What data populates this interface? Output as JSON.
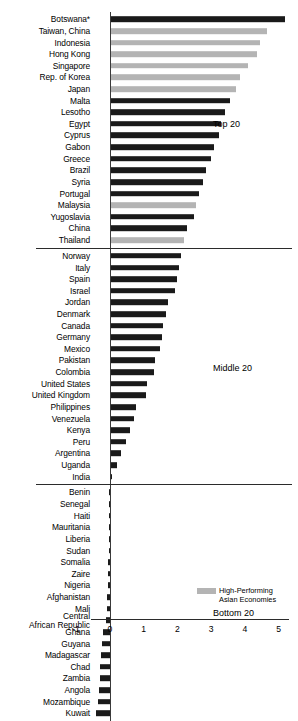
{
  "chart_data": {
    "type": "bar",
    "orientation": "horizontal",
    "title": "",
    "xlabel": "",
    "ylabel": "",
    "xlim": [
      -1,
      5
    ],
    "xticks": [
      -1,
      0,
      1,
      2,
      3,
      4,
      5
    ],
    "xticklabels": [
      "-1",
      "0",
      "1",
      "2",
      "3",
      "4",
      "5"
    ],
    "grid": false,
    "legend": {
      "position": "bottom-right",
      "entries": [
        {
          "label_line1": "High-Performing",
          "label_line2": "Asian Economies",
          "color": "#b4b4b4"
        }
      ]
    },
    "series_colors": {
      "default": "#1a1a1a",
      "highlight": "#b4b4b4"
    },
    "groups": [
      {
        "name": "Top 20",
        "label": "Top 20",
        "categories": [
          "Botswana*",
          "Taiwan, China",
          "Indonesia",
          "Hong Kong",
          "Singapore",
          "Rep. of Korea",
          "Japan",
          "Malta",
          "Lesotho",
          "Egypt",
          "Cyprus",
          "Gabon",
          "Greece",
          "Brazil",
          "Syria",
          "Portugal",
          "Malaysia",
          "Yugoslavia",
          "China",
          "Thailand"
        ],
        "values": [
          5.2,
          4.65,
          4.45,
          4.35,
          4.1,
          3.85,
          3.75,
          3.55,
          3.4,
          3.3,
          3.25,
          3.1,
          3.0,
          2.85,
          2.75,
          2.65,
          2.55,
          2.5,
          2.3,
          2.2
        ],
        "highlight": [
          false,
          true,
          true,
          true,
          true,
          true,
          true,
          false,
          false,
          false,
          false,
          false,
          false,
          false,
          false,
          false,
          true,
          false,
          false,
          true
        ]
      },
      {
        "name": "Middle 20",
        "label": "Middle 20",
        "categories": [
          "Norway",
          "Italy",
          "Spain",
          "Israel",
          "Jordan",
          "Denmark",
          "Canada",
          "Germany",
          "Mexico",
          "Pakistan",
          "Colombia",
          "United States",
          "United Kingdom",
          "Philippines",
          "Venezuela",
          "Kenya",
          "Peru",
          "Argentina",
          "Uganda",
          "India"
        ],
        "values": [
          2.1,
          2.04,
          1.98,
          1.92,
          1.72,
          1.66,
          1.58,
          1.54,
          1.48,
          1.34,
          1.32,
          1.1,
          1.08,
          0.78,
          0.72,
          0.6,
          0.48,
          0.34,
          0.2,
          0.06
        ],
        "highlight": [
          false,
          false,
          false,
          false,
          false,
          false,
          false,
          false,
          false,
          false,
          false,
          false,
          false,
          false,
          false,
          false,
          false,
          false,
          false,
          false
        ]
      },
      {
        "name": "Bottom 20",
        "label": "Bottom 20",
        "categories": [
          "Benin",
          "Senegal",
          "Haiti",
          "Mauritania",
          "Liberia",
          "Sudan",
          "Somalia",
          "Zaire",
          "Nigeria",
          "Afghanistan",
          "Mali",
          "Central\nAfrican Republic",
          "Ghana",
          "Guyana",
          "Madagascar",
          "Chad",
          "Zambia",
          "Angola",
          "Mozambique",
          "Kuwait"
        ],
        "values": [
          -0.01,
          -0.015,
          -0.02,
          -0.025,
          -0.03,
          -0.035,
          -0.04,
          -0.05,
          -0.06,
          -0.07,
          -0.09,
          -0.12,
          -0.2,
          -0.22,
          -0.26,
          -0.28,
          -0.3,
          -0.32,
          -0.34,
          -0.42
        ],
        "highlight": [
          false,
          false,
          false,
          false,
          false,
          false,
          false,
          false,
          false,
          false,
          false,
          false,
          false,
          false,
          false,
          false,
          false,
          false,
          false,
          false
        ]
      }
    ]
  }
}
